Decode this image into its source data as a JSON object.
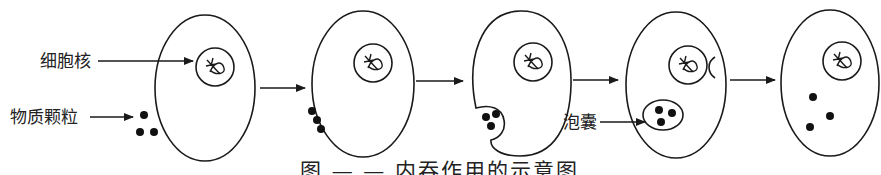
{
  "diagram": {
    "type": "process-sequence",
    "topic": "endocytosis",
    "labels": {
      "nucleus": "细胞核",
      "particles": "物质颗粒",
      "vesicle": "泡囊"
    },
    "caption": "图 — — 内吞作用的示意图",
    "stages": [
      {
        "name": "particles-outside-cell",
        "particle_count": 3,
        "location": "outside"
      },
      {
        "name": "particles-attach-membrane",
        "particle_count": 3,
        "location": "membrane"
      },
      {
        "name": "membrane-invaginates",
        "particle_count": 3,
        "location": "invagination"
      },
      {
        "name": "vesicle-formed",
        "particle_count": 3,
        "location": "vesicle"
      },
      {
        "name": "particles-released",
        "particle_count": 3,
        "location": "cytoplasm"
      }
    ],
    "transition_arrows": 4
  }
}
